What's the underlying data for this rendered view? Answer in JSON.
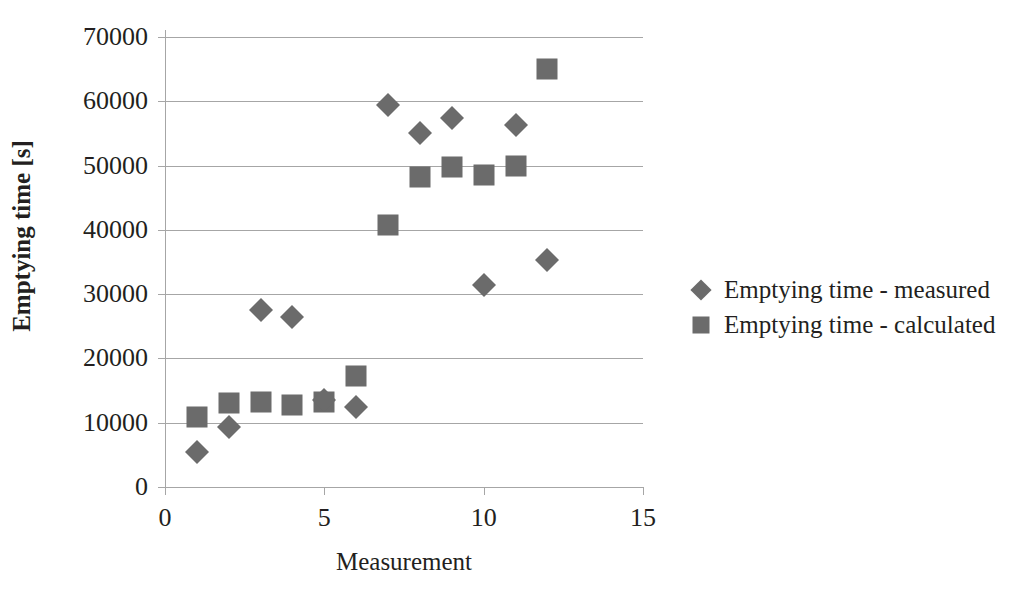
{
  "chart_data": {
    "type": "scatter",
    "title": "",
    "xlabel": "Measurement",
    "ylabel": "Emptying time [s]",
    "xlim": [
      0,
      15
    ],
    "ylim": [
      0,
      70000
    ],
    "xticks": [
      "0",
      "5",
      "10",
      "15"
    ],
    "xtick_values": [
      0,
      5,
      10,
      15
    ],
    "yticks": [
      "0",
      "10000",
      "20000",
      "30000",
      "40000",
      "50000",
      "60000",
      "70000"
    ],
    "ytick_values": [
      0,
      10000,
      20000,
      30000,
      40000,
      50000,
      60000,
      70000
    ],
    "grid": "horizontal",
    "legend_position": "right",
    "marker_color": "#6b6b6b",
    "gridline_color": "#a6a6a6",
    "text_color": "#231f20",
    "series": [
      {
        "name": "Emptying time - measured",
        "marker": "diamond",
        "x": [
          1,
          2,
          3,
          4,
          5,
          6,
          7,
          8,
          9,
          10,
          11,
          12
        ],
        "values": [
          5400,
          9300,
          27600,
          26500,
          13600,
          12400,
          59500,
          55000,
          57400,
          31500,
          56300,
          35300
        ]
      },
      {
        "name": "Emptying time - calculated",
        "marker": "square",
        "x": [
          1,
          2,
          3,
          4,
          5,
          6,
          7,
          8,
          9,
          10,
          11,
          12
        ],
        "values": [
          10900,
          13000,
          13300,
          12800,
          13300,
          17200,
          40800,
          48200,
          49800,
          48500,
          50000,
          65000
        ]
      }
    ]
  },
  "legend": {
    "entries": [
      {
        "label": "Emptying time - measured",
        "marker": "diamond"
      },
      {
        "label": "Emptying time - calculated",
        "marker": "square"
      }
    ]
  }
}
